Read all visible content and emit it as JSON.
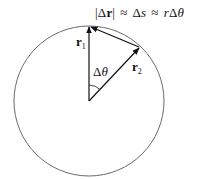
{
  "diagram": {
    "equation": {
      "abs_open": "|",
      "delta_r_delta": "Δ",
      "delta_r_r": "r",
      "abs_close": "|",
      "approx1": "≈",
      "delta_s_delta": "Δ",
      "delta_s_s": "s",
      "approx2": "≈",
      "r_delta_theta_r": "r",
      "r_delta_theta_delta": "Δ",
      "r_delta_theta_theta": "θ"
    },
    "labels": {
      "r1_base": "r",
      "r1_sub": "1",
      "r2_base": "r",
      "r2_sub": "2",
      "angle_delta": "Δ",
      "angle_theta": "θ"
    },
    "geometry": {
      "circle_center": [
        89,
        101
      ],
      "circle_radius": 75,
      "r1_tip": [
        89,
        26
      ],
      "r2_tip": [
        140,
        47
      ],
      "stroke_color": "#555555",
      "vector_color": "#111111"
    }
  }
}
